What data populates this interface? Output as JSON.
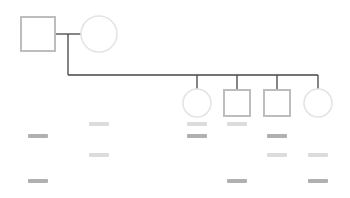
{
  "diagram": {
    "type": "pedigree",
    "colors": {
      "background": "#ffffff",
      "line": "#444444",
      "male_outline": "#bdbdbd",
      "female_outline": "#e4e4e4",
      "label_dark": "#b0b0b0",
      "label_light": "#dcdcdc"
    },
    "parents": [
      {
        "id": "father",
        "sex": "male",
        "shape": "square-icon"
      },
      {
        "id": "mother",
        "sex": "female",
        "shape": "circle-icon"
      }
    ],
    "children": [
      {
        "id": "child-1",
        "sex": "female",
        "shape": "circle-icon"
      },
      {
        "id": "child-2",
        "sex": "male",
        "shape": "square-icon"
      },
      {
        "id": "child-3",
        "sex": "male",
        "shape": "square-icon"
      },
      {
        "id": "child-4",
        "sex": "female",
        "shape": "circle-icon"
      }
    ],
    "redacted_labels": [
      {
        "column": "col-a",
        "row": 2,
        "tone": "dark"
      },
      {
        "column": "col-a",
        "row": 4,
        "tone": "dark"
      },
      {
        "column": "col-b",
        "row": 1,
        "tone": "light"
      },
      {
        "column": "col-b",
        "row": 3,
        "tone": "light"
      },
      {
        "column": "child-1",
        "row": 1,
        "tone": "light"
      },
      {
        "column": "child-1",
        "row": 2,
        "tone": "dark"
      },
      {
        "column": "child-2",
        "row": 1,
        "tone": "light"
      },
      {
        "column": "child-2",
        "row": 4,
        "tone": "dark"
      },
      {
        "column": "child-3",
        "row": 2,
        "tone": "dark"
      },
      {
        "column": "child-3",
        "row": 3,
        "tone": "light"
      },
      {
        "column": "child-4",
        "row": 3,
        "tone": "light"
      },
      {
        "column": "child-4",
        "row": 4,
        "tone": "dark"
      }
    ]
  }
}
